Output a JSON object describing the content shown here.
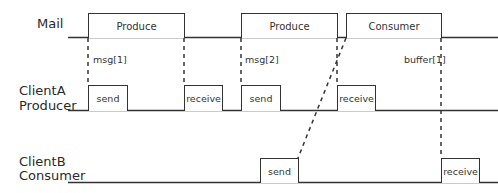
{
  "lanes": [
    {
      "id": "mail",
      "label": "Mail"
    },
    {
      "id": "clientA",
      "label_line1": "ClientA",
      "label_line2": "Producer"
    },
    {
      "id": "clientB",
      "label_line1": "ClientB",
      "label_line2": "Consumer"
    }
  ],
  "mail_boxes": [
    {
      "label": "Produce"
    },
    {
      "label": "Produce"
    },
    {
      "label": "Consumer"
    }
  ],
  "clientA_boxes": [
    {
      "label": "send"
    },
    {
      "label": "receive"
    },
    {
      "label": "send"
    },
    {
      "label": "receive"
    }
  ],
  "clientB_boxes": [
    {
      "label": "send"
    },
    {
      "label": "receive"
    }
  ],
  "annotations": [
    {
      "label": "msg[1]"
    },
    {
      "label": "msg[2]"
    },
    {
      "label": "buffer[1]"
    }
  ],
  "colors": {
    "line": "#333333",
    "text": "#2a2a2a",
    "background": "#ffffff"
  }
}
